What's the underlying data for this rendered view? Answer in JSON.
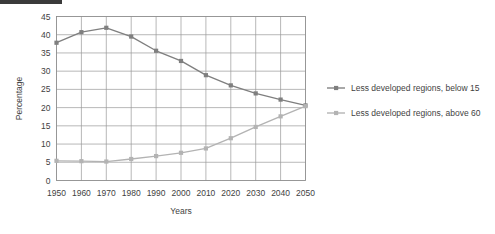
{
  "chart_data": {
    "type": "line",
    "title": "",
    "xlabel": "Years",
    "ylabel": "Percentage",
    "x": [
      1950,
      1960,
      1970,
      1980,
      1990,
      2000,
      2010,
      2020,
      2030,
      2040,
      2050
    ],
    "xtick_labels": [
      "1950",
      "1960",
      "1970",
      "1980",
      "1990",
      "2000",
      "2010",
      "2020",
      "2030",
      "2040",
      "2050"
    ],
    "ytick_labels": [
      "0",
      "5",
      "10",
      "15",
      "20",
      "25",
      "30",
      "35",
      "40",
      "45"
    ],
    "yticks": [
      0,
      5,
      10,
      15,
      20,
      25,
      30,
      35,
      40,
      45
    ],
    "ylim": [
      0,
      45
    ],
    "xlim": [
      1950,
      2050
    ],
    "grid": true,
    "legend_position": "right",
    "series": [
      {
        "name": "Less developed regions, below 15",
        "color": "#7f7f7f",
        "marker": "square",
        "values": [
          37.8,
          40.7,
          41.9,
          39.5,
          35.6,
          32.8,
          28.9,
          26.1,
          23.9,
          22.2,
          20.6
        ]
      },
      {
        "name": "Less developed regions, above 60",
        "color": "#b3b3b3",
        "marker": "square",
        "values": [
          5.4,
          5.3,
          5.2,
          5.9,
          6.7,
          7.6,
          8.8,
          11.6,
          14.7,
          17.6,
          20.4
        ]
      }
    ]
  },
  "legend": {
    "items": [
      {
        "label": "Less developed regions, below 15",
        "color": "#7f7f7f"
      },
      {
        "label": "Less developed regions, above 60",
        "color": "#b3b3b3"
      }
    ]
  },
  "colors": {
    "series_below_15": "#7f7f7f",
    "series_above_60": "#b3b3b3",
    "gridline": "#9a9a9a",
    "text": "#3f3f3f",
    "background": "#ffffff"
  }
}
